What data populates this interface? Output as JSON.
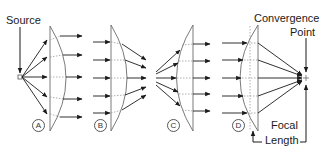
{
  "labels": {
    "source": "Source",
    "convergence_line1": "Convergence",
    "convergence_line2": "Point",
    "focal_line1": "Focal",
    "focal_line2": "Length"
  },
  "panels": [
    {
      "id": "A",
      "label": "A",
      "description": "Point source diverging rays collimated by plano-convex lens (flat side toward source)"
    },
    {
      "id": "B",
      "label": "B",
      "description": "Parallel rays converged by plano-convex lens (flat side toward incoming rays)"
    },
    {
      "id": "C",
      "label": "C",
      "description": "Diverging rays collimated by plano-convex lens (curved side toward source)"
    },
    {
      "id": "D",
      "label": "D",
      "description": "Parallel rays focused to convergence point by plano-convex lens (curved side toward incoming rays)"
    }
  ],
  "colors": {
    "stroke": "#1a1a1a",
    "lens": "#6b6b6b",
    "dotted": "#9a9a9a"
  }
}
